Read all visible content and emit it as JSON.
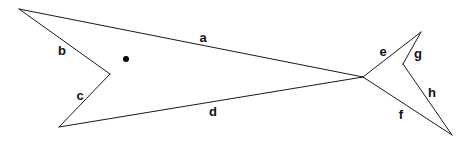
{
  "diagram": {
    "type": "polygon-shape",
    "stroke_color": "#1a1a1a",
    "background": "#ffffff",
    "vertices": {
      "A": [
        19,
        9
      ],
      "B": [
        110,
        74
      ],
      "C": [
        59,
        127
      ],
      "J": [
        363,
        77
      ],
      "E": [
        421,
        32
      ],
      "G": [
        403,
        64
      ],
      "F": [
        452,
        135
      ]
    },
    "edges": [
      {
        "label": "a",
        "from": "A",
        "to": "J",
        "label_pos": [
          203,
          37
        ]
      },
      {
        "label": "b",
        "from": "A",
        "to": "B",
        "label_pos": [
          62,
          50
        ]
      },
      {
        "label": "c",
        "from": "B",
        "to": "C",
        "label_pos": [
          80,
          95
        ]
      },
      {
        "label": "d",
        "from": "C",
        "to": "J",
        "label_pos": [
          213,
          111
        ]
      },
      {
        "label": "e",
        "from": "J",
        "to": "E",
        "label_pos": [
          383,
          51
        ]
      },
      {
        "label": "f",
        "from": "J",
        "to": "F",
        "label_pos": [
          401,
          114
        ]
      },
      {
        "label": "g",
        "from": "E",
        "to": "G",
        "label_pos": [
          418,
          53
        ]
      },
      {
        "label": "h",
        "from": "G",
        "to": "F",
        "label_pos": [
          432,
          92
        ]
      }
    ],
    "dot": {
      "cx": 126,
      "cy": 59,
      "r": 3
    }
  }
}
